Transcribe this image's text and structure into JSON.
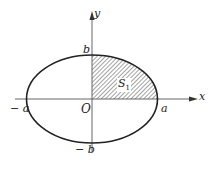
{
  "diagram": {
    "type": "ellipse-area",
    "axes": {
      "x_label": "x",
      "y_label": "y"
    },
    "labels": {
      "origin": "O",
      "pos_a": "a",
      "neg_a": "− a",
      "pos_b": "b",
      "neg_b": "− b",
      "region": "S",
      "region_sub": "1"
    },
    "colors": {
      "stroke": "#222222",
      "axis": "#555555",
      "hatch": "#333333",
      "background": "#ffffff"
    }
  }
}
